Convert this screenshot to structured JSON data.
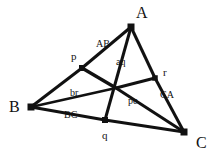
{
  "figure": {
    "type": "geometric-diagram",
    "width": 216,
    "height": 158,
    "background_color": "#ffffff",
    "stroke_color": "#111111",
    "nodes": [
      {
        "id": "A",
        "label": "A",
        "kind": "vertex",
        "x": 131,
        "y": 27,
        "marker": 7,
        "label_x": 136,
        "label_y": 5,
        "label_class": "vertex-label"
      },
      {
        "id": "B",
        "label": "B",
        "kind": "vertex",
        "x": 31,
        "y": 107,
        "marker": 7,
        "label_x": 9,
        "label_y": 99,
        "label_class": "vertex-label"
      },
      {
        "id": "C",
        "label": "C",
        "kind": "vertex",
        "x": 184,
        "y": 132,
        "marker": 7,
        "label_x": 196,
        "label_y": 135,
        "label_class": "vertex-label"
      },
      {
        "id": "p",
        "label": "p",
        "kind": "point",
        "x": 82,
        "y": 68,
        "marker": 6,
        "label_x": 71,
        "label_y": 51,
        "label_class": "point-label"
      },
      {
        "id": "q",
        "label": "q",
        "kind": "point",
        "x": 105,
        "y": 120,
        "marker": 6,
        "label_x": 102,
        "label_y": 130,
        "label_class": "point-label"
      },
      {
        "id": "r",
        "label": "r",
        "kind": "point",
        "x": 155,
        "y": 78,
        "marker": 5.5,
        "label_x": 163,
        "label_y": 67,
        "label_class": "point-label"
      },
      {
        "id": "center",
        "label": "",
        "kind": "junction",
        "x": 116,
        "y": 88,
        "marker": 0,
        "label_x": 0,
        "label_y": 0,
        "label_class": "point-label"
      }
    ],
    "edges": [
      {
        "id": "A-p",
        "from": "A",
        "to": "p",
        "width": 3.0,
        "label": "AB",
        "label_x": 96,
        "label_y": 39
      },
      {
        "id": "A-center-q",
        "from": "A",
        "to": "q",
        "width": 3.0,
        "label": "aq",
        "label_x": 116,
        "label_y": 57
      },
      {
        "id": "A-r",
        "from": "A",
        "to": "r",
        "width": 3.0,
        "label": "",
        "label_x": 0,
        "label_y": 0
      },
      {
        "id": "B-p",
        "from": "B",
        "to": "p",
        "width": 3.0,
        "label": "",
        "label_x": 0,
        "label_y": 0
      },
      {
        "id": "B-center",
        "from": "B",
        "to": "center",
        "width": 2.4,
        "label": "br",
        "label_x": 70,
        "label_y": 88
      },
      {
        "id": "B-q",
        "from": "B",
        "to": "q",
        "width": 3.0,
        "label": "BC",
        "label_x": 64,
        "label_y": 110
      },
      {
        "id": "q-C",
        "from": "q",
        "to": "C",
        "width": 3.0,
        "label": "",
        "label_x": 0,
        "label_y": 0
      },
      {
        "id": "C-center",
        "from": "C",
        "to": "center",
        "width": 3.0,
        "label": "pc",
        "label_x": 128,
        "label_y": 96
      },
      {
        "id": "C-r",
        "from": "C",
        "to": "r",
        "width": 3.0,
        "label": "CA",
        "label_x": 160,
        "label_y": 90
      },
      {
        "id": "p-center",
        "from": "p",
        "to": "center",
        "width": 3.4,
        "label": "",
        "label_x": 0,
        "label_y": 0
      },
      {
        "id": "center-r",
        "from": "center",
        "to": "r",
        "width": 3.0,
        "label": "",
        "label_x": 0,
        "label_y": 0
      }
    ]
  }
}
